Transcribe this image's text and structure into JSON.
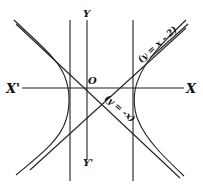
{
  "figure": {
    "labels": {
      "x_axis_pos": "X",
      "x_axis_neg": "X'",
      "y_axis_pos": "Y",
      "y_axis_neg": "Y'",
      "origin": "O",
      "asymptote_1": "(y = x - 2)",
      "asymptote_2": "(y = -x)"
    },
    "colors": {
      "ink": "#222222",
      "background": "#ffffff"
    }
  }
}
